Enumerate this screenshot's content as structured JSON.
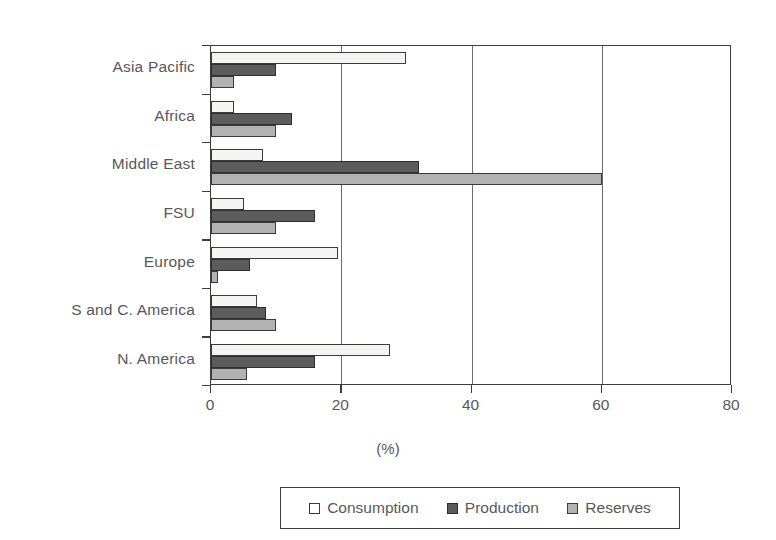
{
  "chart_data": {
    "type": "bar",
    "orientation": "horizontal",
    "title": "",
    "xlabel": "(%)",
    "ylabel": "",
    "xlim": [
      0,
      80
    ],
    "xticks": [
      0,
      20,
      40,
      60,
      80
    ],
    "xtick_labels": [
      "0",
      "20",
      "40",
      "60",
      "80"
    ],
    "gridlines": [
      20,
      40,
      60
    ],
    "grid": true,
    "legend_position": "bottom",
    "categories": [
      "Asia Pacific",
      "Africa",
      "Middle East",
      "FSU",
      "Europe",
      "S and C. America",
      "N. America"
    ],
    "series": [
      {
        "name": "Consumption",
        "color": "#f4f4f2",
        "values": [
          30,
          3.5,
          8,
          5,
          19.5,
          7,
          27.5
        ]
      },
      {
        "name": "Production",
        "color": "#5c5c5c",
        "values": [
          10,
          12.5,
          32,
          16,
          6,
          8.5,
          16
        ]
      },
      {
        "name": "Reserves",
        "color": "#b2b2b2",
        "values": [
          3.5,
          10,
          60,
          10,
          1,
          10,
          5.5
        ]
      }
    ]
  },
  "legend": {
    "items": [
      {
        "label": "Consumption",
        "swatch": "consumption"
      },
      {
        "label": "Production",
        "swatch": "production"
      },
      {
        "label": "Reserves",
        "swatch": "reserves"
      }
    ]
  }
}
